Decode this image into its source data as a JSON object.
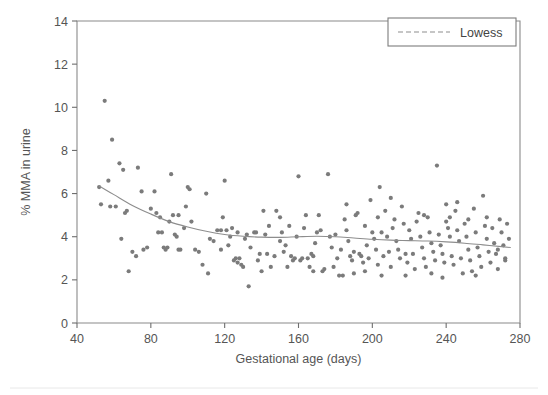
{
  "figure": {
    "background_color": "#ffffff",
    "marker_color": "#7b7b7b",
    "line_color": "#8d8d8d",
    "axis_color": "#6e6e6e"
  },
  "chart_data": {
    "type": "scatter",
    "title": "",
    "xlabel": "Gestational age (days)",
    "ylabel": "% MMA in urine",
    "xlim": [
      40,
      280
    ],
    "ylim": [
      0,
      14
    ],
    "xticks": [
      40,
      80,
      120,
      160,
      200,
      240,
      280
    ],
    "yticks": [
      0,
      2,
      4,
      6,
      8,
      10,
      12,
      14
    ],
    "grid": false,
    "legend": {
      "position": "top-right",
      "entries": [
        {
          "label": "Lowess",
          "style": "dashed-line",
          "color": "#8d8d8d"
        }
      ]
    },
    "series": [
      {
        "name": "observations",
        "type": "scatter",
        "marker": "circle",
        "color": "#7b7b7b",
        "points": [
          [
            52,
            6.3
          ],
          [
            53,
            5.5
          ],
          [
            55,
            10.3
          ],
          [
            57,
            6.6
          ],
          [
            58,
            5.4
          ],
          [
            59,
            8.5
          ],
          [
            61,
            5.4
          ],
          [
            63,
            7.4
          ],
          [
            64,
            3.9
          ],
          [
            65,
            7.1
          ],
          [
            66,
            5.1
          ],
          [
            67,
            5.2
          ],
          [
            68,
            2.4
          ],
          [
            70,
            3.3
          ],
          [
            72,
            3.1
          ],
          [
            73,
            7.2
          ],
          [
            75,
            6.1
          ],
          [
            76,
            3.4
          ],
          [
            78,
            3.5
          ],
          [
            80,
            5.3
          ],
          [
            82,
            6.1
          ],
          [
            83,
            5.1
          ],
          [
            84,
            4.2
          ],
          [
            85,
            4.9
          ],
          [
            86,
            4.2
          ],
          [
            87,
            3.5
          ],
          [
            88,
            3.4
          ],
          [
            89,
            3.5
          ],
          [
            90,
            4.7
          ],
          [
            91,
            6.9
          ],
          [
            92,
            5.0
          ],
          [
            93,
            4.1
          ],
          [
            94,
            4.0
          ],
          [
            95,
            3.4
          ],
          [
            96,
            3.4
          ],
          [
            98,
            4.4
          ],
          [
            99,
            5.4
          ],
          [
            100,
            6.3
          ],
          [
            101,
            6.2
          ],
          [
            102,
            4.7
          ],
          [
            104,
            3.4
          ],
          [
            106,
            3.3
          ],
          [
            108,
            2.7
          ],
          [
            110,
            6.0
          ],
          [
            111,
            2.3
          ],
          [
            112,
            3.9
          ],
          [
            114,
            3.8
          ],
          [
            116,
            4.3
          ],
          [
            118,
            4.3
          ],
          [
            119,
            4.9
          ],
          [
            120,
            6.6
          ],
          [
            121,
            4.3
          ],
          [
            122,
            3.6
          ],
          [
            123,
            4.0
          ],
          [
            124,
            4.4
          ],
          [
            125,
            2.9
          ],
          [
            126,
            3.0
          ],
          [
            127,
            2.8
          ],
          [
            128,
            3.0
          ],
          [
            129,
            2.7
          ],
          [
            130,
            2.6
          ],
          [
            131,
            3.9
          ],
          [
            132,
            4.1
          ],
          [
            133,
            1.7
          ],
          [
            134,
            3.5
          ],
          [
            136,
            4.2
          ],
          [
            137,
            4.2
          ],
          [
            138,
            2.9
          ],
          [
            139,
            3.2
          ],
          [
            140,
            2.4
          ],
          [
            141,
            5.2
          ],
          [
            142,
            4.1
          ],
          [
            143,
            3.2
          ],
          [
            144,
            4.5
          ],
          [
            145,
            2.6
          ],
          [
            147,
            3.1
          ],
          [
            148,
            5.2
          ],
          [
            150,
            3.8
          ],
          [
            151,
            4.2
          ],
          [
            152,
            3.3
          ],
          [
            153,
            3.6
          ],
          [
            154,
            2.6
          ],
          [
            155,
            4.5
          ],
          [
            156,
            3.1
          ],
          [
            157,
            2.9
          ],
          [
            158,
            3.0
          ],
          [
            159,
            4.0
          ],
          [
            160,
            6.8
          ],
          [
            161,
            2.9
          ],
          [
            162,
            3.0
          ],
          [
            163,
            4.4
          ],
          [
            164,
            5.0
          ],
          [
            165,
            3.0
          ],
          [
            166,
            2.6
          ],
          [
            167,
            3.2
          ],
          [
            168,
            3.1
          ],
          [
            169,
            3.7
          ],
          [
            170,
            4.2
          ],
          [
            171,
            5.0
          ],
          [
            172,
            4.3
          ],
          [
            173,
            2.4
          ],
          [
            174,
            2.5
          ],
          [
            176,
            6.9
          ],
          [
            177,
            4.0
          ],
          [
            178,
            3.5
          ],
          [
            179,
            2.6
          ],
          [
            180,
            4.1
          ],
          [
            181,
            3.0
          ],
          [
            182,
            2.2
          ],
          [
            183,
            3.4
          ],
          [
            184,
            2.2
          ],
          [
            185,
            4.8
          ],
          [
            186,
            4.3
          ],
          [
            187,
            3.8
          ],
          [
            188,
            3.1
          ],
          [
            189,
            2.9
          ],
          [
            190,
            3.3
          ],
          [
            191,
            5.0
          ],
          [
            192,
            5.1
          ],
          [
            193,
            3.2
          ],
          [
            194,
            3.1
          ],
          [
            195,
            2.8
          ],
          [
            196,
            4.5
          ],
          [
            197,
            3.6
          ],
          [
            198,
            3.0
          ],
          [
            199,
            5.7
          ],
          [
            200,
            4.2
          ],
          [
            201,
            3.9
          ],
          [
            202,
            3.4
          ],
          [
            203,
            2.7
          ],
          [
            204,
            6.3
          ],
          [
            205,
            4.2
          ],
          [
            206,
            3.1
          ],
          [
            207,
            5.2
          ],
          [
            208,
            4.0
          ],
          [
            209,
            3.3
          ],
          [
            210,
            2.6
          ],
          [
            211,
            4.4
          ],
          [
            212,
            4.8
          ],
          [
            213,
            3.8
          ],
          [
            214,
            3.4
          ],
          [
            215,
            3.0
          ],
          [
            216,
            5.4
          ],
          [
            217,
            4.6
          ],
          [
            218,
            3.2
          ],
          [
            219,
            2.8
          ],
          [
            220,
            4.3
          ],
          [
            221,
            3.9
          ],
          [
            222,
            3.2
          ],
          [
            223,
            2.5
          ],
          [
            224,
            4.7
          ],
          [
            225,
            5.1
          ],
          [
            226,
            4.0
          ],
          [
            227,
            3.5
          ],
          [
            228,
            3.0
          ],
          [
            229,
            2.6
          ],
          [
            230,
            4.9
          ],
          [
            231,
            4.2
          ],
          [
            232,
            3.7
          ],
          [
            233,
            3.3
          ],
          [
            234,
            2.9
          ],
          [
            235,
            7.3
          ],
          [
            236,
            4.1
          ],
          [
            237,
            3.6
          ],
          [
            238,
            3.2
          ],
          [
            239,
            2.8
          ],
          [
            240,
            5.5
          ],
          [
            241,
            4.4
          ],
          [
            242,
            4.0
          ],
          [
            243,
            3.1
          ],
          [
            244,
            2.7
          ],
          [
            245,
            5.2
          ],
          [
            246,
            4.3
          ],
          [
            247,
            3.8
          ],
          [
            248,
            3.0
          ],
          [
            249,
            2.3
          ],
          [
            250,
            4.6
          ],
          [
            251,
            4.0
          ],
          [
            252,
            3.4
          ],
          [
            253,
            2.9
          ],
          [
            254,
            2.4
          ],
          [
            255,
            5.3
          ],
          [
            256,
            4.2
          ],
          [
            257,
            3.5
          ],
          [
            258,
            3.1
          ],
          [
            259,
            2.6
          ],
          [
            260,
            5.9
          ],
          [
            261,
            4.5
          ],
          [
            262,
            3.9
          ],
          [
            263,
            3.3
          ],
          [
            264,
            2.8
          ],
          [
            265,
            4.4
          ],
          [
            266,
            3.7
          ],
          [
            267,
            3.2
          ],
          [
            268,
            2.5
          ],
          [
            269,
            4.8
          ],
          [
            270,
            4.2
          ],
          [
            271,
            3.6
          ],
          [
            272,
            3.0
          ],
          [
            273,
            4.6
          ],
          [
            274,
            3.9
          ],
          [
            186,
            5.5
          ],
          [
            210,
            5.8
          ],
          [
            246,
            5.6
          ],
          [
            262,
            4.9
          ],
          [
            203,
            4.9
          ],
          [
            228,
            5.0
          ],
          [
            252,
            4.8
          ],
          [
            150,
            4.9
          ],
          [
            127,
            4.2
          ],
          [
            118,
            3.4
          ],
          [
            95,
            5.0
          ],
          [
            205,
            2.2
          ],
          [
            218,
            2.2
          ],
          [
            238,
            2.1
          ],
          [
            190,
            2.3
          ],
          [
            168,
            2.4
          ],
          [
            240,
            4.7
          ],
          [
            242,
            4.9
          ],
          [
            256,
            2.2
          ],
          [
            268,
            3.4
          ],
          [
            272,
            2.9
          ],
          [
            232,
            2.3
          ],
          [
            196,
            2.4
          ]
        ]
      },
      {
        "name": "Lowess",
        "type": "line",
        "style": "solid-thin",
        "color": "#8d8d8d",
        "points": [
          [
            52,
            6.35
          ],
          [
            60,
            5.95
          ],
          [
            70,
            5.45
          ],
          [
            80,
            5.05
          ],
          [
            90,
            4.7
          ],
          [
            100,
            4.45
          ],
          [
            110,
            4.25
          ],
          [
            120,
            4.1
          ],
          [
            130,
            4.02
          ],
          [
            140,
            3.98
          ],
          [
            150,
            3.97
          ],
          [
            160,
            4.0
          ],
          [
            170,
            4.02
          ],
          [
            180,
            4.0
          ],
          [
            190,
            3.94
          ],
          [
            200,
            3.88
          ],
          [
            210,
            3.84
          ],
          [
            220,
            3.82
          ],
          [
            230,
            3.8
          ],
          [
            240,
            3.76
          ],
          [
            250,
            3.7
          ],
          [
            260,
            3.62
          ],
          [
            270,
            3.54
          ],
          [
            275,
            3.5
          ]
        ]
      }
    ]
  }
}
